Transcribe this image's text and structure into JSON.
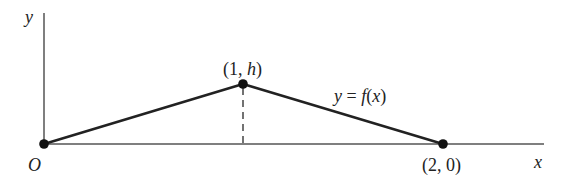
{
  "diagram": {
    "type": "piecewise-linear-function-graph",
    "axes": {
      "x_label": "x",
      "y_label": "y",
      "origin_label": "O"
    },
    "points": [
      {
        "id": "origin",
        "label": "O",
        "x": 0,
        "y": 0
      },
      {
        "id": "peak",
        "label_open": "(1, ",
        "label_var": "h",
        "label_close": ")",
        "x": 1,
        "y": "h"
      },
      {
        "id": "end",
        "label": "(2, 0)",
        "x": 2,
        "y": 0
      }
    ],
    "curve_label": {
      "lhs": "y",
      "eq": " = ",
      "fn": "f",
      "open": "(",
      "arg": "x",
      "close": ")"
    },
    "dashed_line": "vertical from (1, h) to x-axis",
    "colors": {
      "axis": "#555555",
      "curve": "#222222",
      "point": "#111111",
      "text": "#222222"
    }
  }
}
